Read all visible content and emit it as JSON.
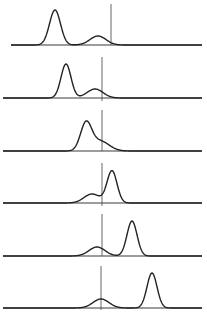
{
  "chart_data": {
    "type": "line",
    "title": "",
    "xlabel": "",
    "ylabel": "",
    "grid": false,
    "legend": null,
    "panels": [
      {
        "index": 1,
        "baseline_y": 45,
        "x_start": 11,
        "x_end": 202,
        "refline": {
          "x": 111,
          "y_top": 4,
          "y_bottom": 45
        },
        "components": [
          {
            "center": 55,
            "sigma": 5.5,
            "height": 35
          },
          {
            "center": 98,
            "sigma": 8,
            "height": 9
          }
        ]
      },
      {
        "index": 2,
        "baseline_y": 98,
        "x_start": 3,
        "x_end": 202,
        "refline": {
          "x": 102,
          "y_top": 57,
          "y_bottom": 101
        },
        "components": [
          {
            "center": 66,
            "sigma": 5,
            "height": 34
          },
          {
            "center": 95,
            "sigma": 8,
            "height": 9
          }
        ]
      },
      {
        "index": 3,
        "baseline_y": 151,
        "x_start": 3,
        "x_end": 202,
        "refline": {
          "x": 102,
          "y_top": 110,
          "y_bottom": 151
        },
        "components": [
          {
            "center": 86,
            "sigma": 5.5,
            "height": 27
          },
          {
            "center": 100,
            "sigma": 9,
            "height": 10
          }
        ]
      },
      {
        "index": 4,
        "baseline_y": 203,
        "x_start": 3,
        "x_end": 202,
        "refline": {
          "x": 102,
          "y_top": 163,
          "y_bottom": 206
        },
        "components": [
          {
            "center": 112,
            "sigma": 5,
            "height": 32
          },
          {
            "center": 92,
            "sigma": 8,
            "height": 9
          }
        ]
      },
      {
        "index": 5,
        "baseline_y": 256,
        "x_start": 3,
        "x_end": 202,
        "refline": {
          "x": 102,
          "y_top": 214,
          "y_bottom": 256
        },
        "components": [
          {
            "center": 132,
            "sigma": 5,
            "height": 35
          },
          {
            "center": 97,
            "sigma": 8,
            "height": 9
          }
        ]
      },
      {
        "index": 6,
        "baseline_y": 308,
        "x_start": 3,
        "x_end": 202,
        "refline": {
          "x": 101,
          "y_top": 266,
          "y_bottom": 310
        },
        "components": [
          {
            "center": 152,
            "sigma": 5,
            "height": 35
          },
          {
            "center": 101,
            "sigma": 8,
            "height": 9
          }
        ]
      }
    ]
  },
  "colors": {
    "background": "#ffffff",
    "curve": "#222222",
    "baseline": "#3a3a3a",
    "refline": "#555555"
  }
}
